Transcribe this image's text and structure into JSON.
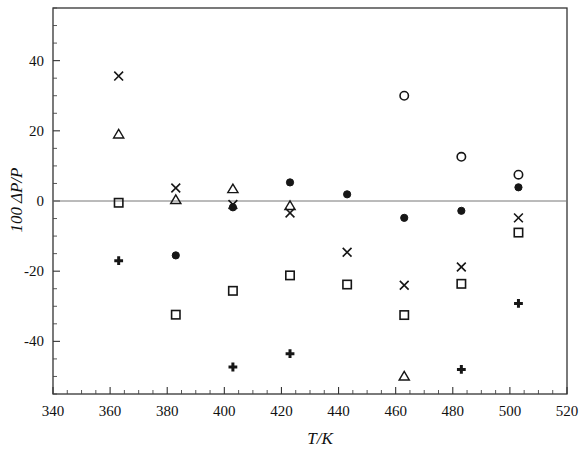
{
  "chart_data": {
    "type": "scatter",
    "title": "",
    "subtitle": "",
    "xlabel": "T/K",
    "ylabel": "100 ΔP/P",
    "xlim": [
      340,
      520
    ],
    "ylim": [
      -55,
      55
    ],
    "xticks": [
      340,
      360,
      380,
      400,
      420,
      440,
      460,
      480,
      500,
      520
    ],
    "xtick_labels": [
      "340",
      "360",
      "380",
      "400",
      "420",
      "440",
      "460",
      "480",
      "500",
      "520"
    ],
    "yticks": [
      -40,
      -20,
      0,
      20,
      40
    ],
    "ytick_labels": [
      "-40",
      "-20",
      "0",
      "20",
      "40"
    ],
    "minor_tick_step_x": 5,
    "minor_tick_step_y": 5,
    "grid": false,
    "legend": "none",
    "zero_reference_line": 0,
    "annotations": [],
    "series": [
      {
        "name": "cross",
        "marker": "x",
        "x": [
          363,
          383,
          403,
          423,
          443,
          463,
          483,
          503
        ],
        "y": [
          35.6,
          3.7,
          -1.0,
          -3.4,
          -14.6,
          -24.0,
          -18.8,
          -4.8
        ]
      },
      {
        "name": "open-triangle",
        "marker": "triangle",
        "x": [
          363,
          383,
          403,
          423,
          463
        ],
        "y": [
          19.0,
          0.3,
          3.4,
          -1.4,
          -50.0
        ]
      },
      {
        "name": "open-square",
        "marker": "square",
        "x": [
          363,
          383,
          403,
          423,
          443,
          463,
          483,
          503
        ],
        "y": [
          -0.5,
          -32.4,
          -25.6,
          -21.2,
          -23.8,
          -32.5,
          -23.6,
          -9.0
        ]
      },
      {
        "name": "plus",
        "marker": "plus",
        "x": [
          363,
          403,
          423,
          483,
          503
        ],
        "y": [
          -17.0,
          -47.3,
          -43.5,
          -48.0,
          -29.2
        ]
      },
      {
        "name": "filled-circle",
        "marker": "filled-circle",
        "x": [
          383,
          403,
          423,
          443,
          463,
          483,
          503
        ],
        "y": [
          -15.5,
          -1.8,
          5.3,
          1.9,
          -4.8,
          -2.8,
          3.9
        ]
      },
      {
        "name": "open-circle",
        "marker": "circle",
        "x": [
          463,
          483,
          503
        ],
        "y": [
          30.0,
          12.6,
          7.5
        ]
      }
    ]
  },
  "colors": {
    "marker": "#161616",
    "frame": "#333333",
    "zero_line": "#777777",
    "background": "#ffffff"
  }
}
